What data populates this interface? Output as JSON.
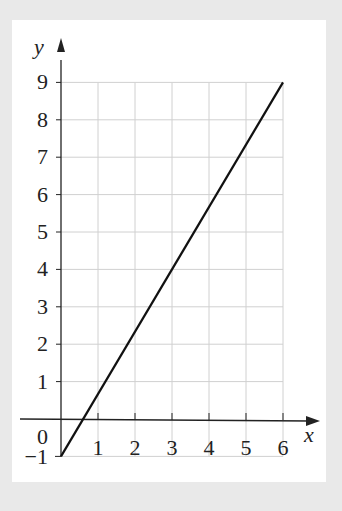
{
  "chart_data": {
    "type": "line",
    "title": "",
    "xlabel": "x",
    "ylabel": "y",
    "xlim": [
      0,
      6
    ],
    "ylim": [
      -1,
      9
    ],
    "x_ticks": [
      "1",
      "2",
      "3",
      "4",
      "5",
      "6"
    ],
    "y_ticks": [
      "9",
      "8",
      "7",
      "6",
      "5",
      "4",
      "3",
      "2",
      "1"
    ],
    "origin_label": "0",
    "y_min_label": "−1",
    "grid": true,
    "series": [
      {
        "name": "y = (5/3)x − 1",
        "x": [
          0,
          6
        ],
        "y": [
          -1,
          9
        ]
      }
    ],
    "colors": {
      "line": "#111111",
      "grid": "#d0d0d0",
      "background": "#e9e9e9",
      "panel": "#ffffff"
    }
  }
}
